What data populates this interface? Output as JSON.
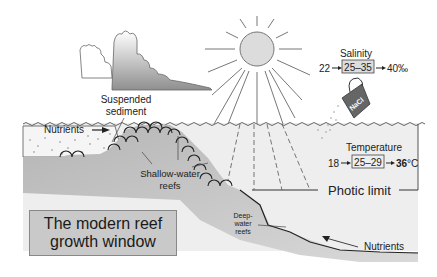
{
  "diagram": {
    "title_line1": "The modern reef",
    "title_line2": "growth window",
    "labels": {
      "suspended_sediment_1": "Suspended",
      "suspended_sediment_2": "sediment",
      "nutrients_top": "Nutrients",
      "shallow_reefs_1": "Shallow-water",
      "shallow_reefs_2": "reefs",
      "deep_reefs_1": "Deep-",
      "deep_reefs_2": "water",
      "deep_reefs_3": "reefs",
      "nutrients_bottom": "Nutrients",
      "photic_limit": "Photic limit"
    },
    "salinity": {
      "label": "Salinity",
      "min": "22",
      "range": "25–35",
      "max": "40‰"
    },
    "temperature": {
      "label": "Temperature",
      "min": "18",
      "range": "25–29",
      "max": "36",
      "unit": "°C"
    },
    "jug_label": "NaCl",
    "icons": [
      "cloud-icon",
      "sun-icon",
      "salt-jug-icon"
    ],
    "colors": {
      "seafloor": "#b8b8b8",
      "water": "#ececec",
      "sediment": "#f0f0f0",
      "cloud_dark": "#9a9a9a",
      "sun": "#dcdcdc",
      "jug": "#6a6a6a",
      "title_box": "#c9c9c9"
    }
  }
}
